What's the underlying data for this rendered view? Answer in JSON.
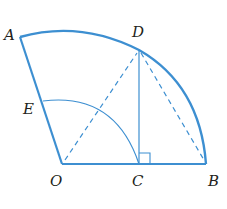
{
  "diagram": {
    "type": "geometry-sector",
    "colors": {
      "stroke": "#3d8fd1",
      "label": "#231f20",
      "background": "#ffffff"
    },
    "points": {
      "O": {
        "label": "O",
        "x": 62,
        "y": 164
      },
      "A": {
        "label": "A",
        "x": 20,
        "y": 37
      },
      "B": {
        "label": "B",
        "x": 206,
        "y": 164
      },
      "C": {
        "label": "C",
        "x": 139,
        "y": 164
      },
      "D": {
        "label": "D",
        "x": 139,
        "y": 50
      },
      "E": {
        "label": "E",
        "x": 43,
        "y": 101
      }
    },
    "segments": [
      {
        "from": "O",
        "to": "A",
        "style": "solid"
      },
      {
        "from": "O",
        "to": "B",
        "style": "solid"
      },
      {
        "from": "D",
        "to": "C",
        "style": "solid"
      },
      {
        "from": "O",
        "to": "D",
        "style": "dashed"
      },
      {
        "from": "D",
        "to": "B",
        "style": "dashed"
      }
    ],
    "arcs": [
      {
        "name": "outer-arc",
        "center": "O",
        "through": [
          "A",
          "D",
          "B"
        ],
        "style": "solid"
      },
      {
        "name": "inner-arc",
        "center": "O",
        "through": [
          "E",
          "C"
        ],
        "style": "solid"
      }
    ],
    "right_angle": {
      "at": "C",
      "between": [
        "D",
        "B"
      ]
    }
  }
}
